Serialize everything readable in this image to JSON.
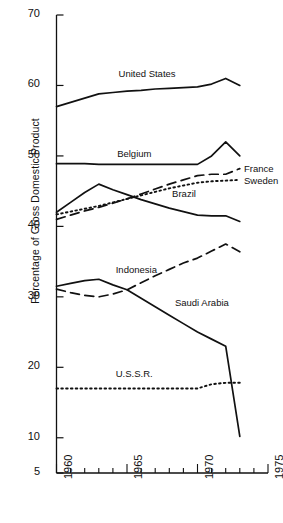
{
  "chart_data": {
    "type": "line",
    "title": "",
    "xlabel": "",
    "ylabel": "Percentage of Gross Domestic Product",
    "xlim": [
      1960,
      1975
    ],
    "ylim": [
      5,
      70
    ],
    "xticks": [
      1960,
      1965,
      1970,
      1975
    ],
    "yticks": [
      5,
      10,
      20,
      30,
      40,
      50,
      60,
      70
    ],
    "xtick_labels": [
      "1960",
      "1965",
      "1970",
      "1975"
    ],
    "ytick_labels": [
      "5",
      "10",
      "20",
      "30",
      "40",
      "50",
      "60",
      "70"
    ],
    "grid": false,
    "legend": "inline-labels",
    "x": [
      1960,
      1961,
      1962,
      1963,
      1964,
      1965,
      1966,
      1967,
      1968,
      1969,
      1970,
      1971,
      1972,
      1973
    ],
    "series": [
      {
        "name": "United States",
        "style": "solid",
        "label": "United States",
        "label_x": 1964.4,
        "label_y": 61.6,
        "values": [
          57.0,
          57.6,
          58.2,
          58.8,
          59.0,
          59.2,
          59.3,
          59.5,
          59.6,
          59.7,
          59.8,
          60.2,
          61.0,
          60.0
        ]
      },
      {
        "name": "Belgium",
        "style": "solid",
        "label": "Belgium",
        "label_x": 1964.3,
        "label_y": 50.3,
        "values": [
          48.9,
          48.9,
          48.9,
          48.8,
          48.8,
          48.8,
          48.8,
          48.8,
          48.8,
          48.8,
          48.8,
          50.0,
          52.0,
          50.0
        ]
      },
      {
        "name": "France",
        "style": "dashed",
        "label": "France",
        "label_x": 1973.3,
        "label_y": 48.1,
        "values": [
          41.0,
          41.6,
          42.2,
          42.7,
          43.3,
          43.9,
          44.6,
          45.3,
          46.0,
          46.6,
          47.2,
          47.4,
          47.4,
          48.2
        ]
      },
      {
        "name": "Sweden",
        "style": "dotted",
        "label": "Sweden",
        "label_x": 1973.3,
        "label_y": 46.5,
        "values": [
          41.7,
          42.1,
          42.5,
          42.9,
          43.4,
          43.9,
          44.4,
          44.9,
          45.4,
          45.8,
          46.2,
          46.4,
          46.5,
          46.6
        ]
      },
      {
        "name": "Brazil",
        "style": "solid",
        "label": "Brazil",
        "label_x": 1968.2,
        "label_y": 44.6,
        "values": [
          42.0,
          43.4,
          44.8,
          46.0,
          45.2,
          44.5,
          43.8,
          43.2,
          42.6,
          42.1,
          41.6,
          41.5,
          41.5,
          40.7
        ]
      },
      {
        "name": "Indonesia",
        "style": "dashed",
        "label": "Indonesia",
        "label_x": 1964.2,
        "label_y": 33.8,
        "values": [
          31.1,
          30.6,
          30.2,
          30.0,
          30.4,
          31.0,
          32.0,
          33.0,
          33.9,
          34.8,
          35.5,
          36.5,
          37.5,
          36.4
        ]
      },
      {
        "name": "Saudi Arabia",
        "style": "solid",
        "label": "Saudi Arabia",
        "label_x": 1968.4,
        "label_y": 29.1,
        "values": [
          31.5,
          31.9,
          32.3,
          32.5,
          31.7,
          31.0,
          29.8,
          28.6,
          27.4,
          26.2,
          25.0,
          24.0,
          23.0,
          10.2
        ]
      },
      {
        "name": "U.S.S.R.",
        "style": "dotted",
        "label": "U.S.S.R.",
        "label_x": 1964.2,
        "label_y": 19.1,
        "values": [
          17.0,
          17.0,
          17.0,
          17.0,
          17.0,
          17.0,
          17.0,
          17.0,
          17.0,
          17.0,
          17.0,
          17.6,
          17.8,
          17.8
        ]
      }
    ]
  }
}
